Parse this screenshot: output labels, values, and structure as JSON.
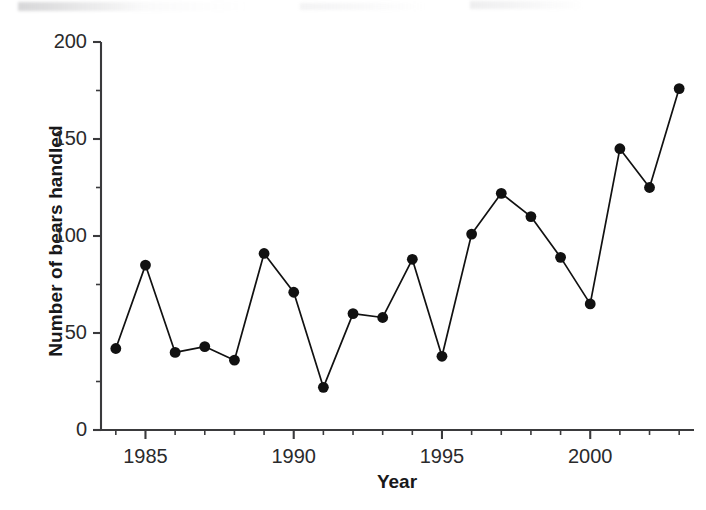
{
  "chart_data": {
    "type": "line",
    "title": "",
    "xlabel": "Year",
    "ylabel": "Number of bears handled",
    "xlim": [
      1983.5,
      2003.5
    ],
    "ylim": [
      0,
      200
    ],
    "grid": false,
    "legend": null,
    "y_major_ticks": [
      0,
      50,
      100,
      150,
      200
    ],
    "y_tick_labels": [
      "0",
      "50",
      "100",
      "150",
      "200"
    ],
    "y_minor_ticks": [
      25,
      75,
      125,
      175
    ],
    "x_major_ticks": [
      1985,
      1990,
      1995,
      2000
    ],
    "x_tick_labels": [
      "1985",
      "1990",
      "1995",
      "2000"
    ],
    "x_minor_ticks": [
      1984,
      1986,
      1987,
      1988,
      1989,
      1991,
      1992,
      1993,
      1994,
      1996,
      1997,
      1998,
      1999,
      2001,
      2002,
      2003
    ],
    "marker": "filled-circle",
    "marker_color": "#111111",
    "line_color": "#111111",
    "x": [
      1984,
      1985,
      1986,
      1987,
      1988,
      1989,
      1990,
      1991,
      1992,
      1993,
      1994,
      1995,
      1996,
      1997,
      1998,
      1999,
      2000,
      2001,
      2002,
      2003
    ],
    "values": [
      42,
      85,
      40,
      43,
      36,
      91,
      71,
      22,
      60,
      58,
      88,
      38,
      101,
      122,
      110,
      89,
      65,
      145,
      125,
      176
    ],
    "series": [
      {
        "name": "Number of bears handled",
        "x": [
          1984,
          1985,
          1986,
          1987,
          1988,
          1989,
          1990,
          1991,
          1992,
          1993,
          1994,
          1995,
          1996,
          1997,
          1998,
          1999,
          2000,
          2001,
          2002,
          2003
        ],
        "values": [
          42,
          85,
          40,
          43,
          36,
          91,
          71,
          22,
          60,
          58,
          88,
          38,
          101,
          122,
          110,
          89,
          65,
          145,
          125,
          176
        ]
      }
    ]
  },
  "axes": {
    "y_title": "Number of bears handled",
    "x_title": "Year"
  }
}
